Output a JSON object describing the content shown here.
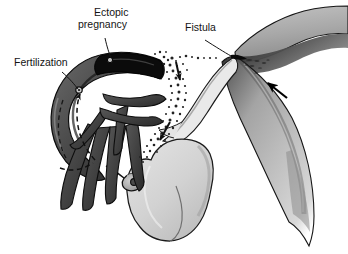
{
  "figure": {
    "kind": "medical-illustration",
    "background_color": "#ffffff",
    "ink_color": "#141414"
  },
  "labels": [
    {
      "id": "fertilization",
      "text": "Fertilization",
      "x": 14,
      "y": 66
    },
    {
      "id": "ectopic-pregnancy",
      "line1": "Ectopic",
      "line2": "pregnancy",
      "x": 78,
      "y": 16
    },
    {
      "id": "fistula",
      "text": "Fistula",
      "x": 185,
      "y": 31
    }
  ],
  "anatomy": {
    "fallopian_tube": {
      "name": "fallopian-tube",
      "fill": "#5d5d5d",
      "stroke": "#111111"
    },
    "ectopic_swelling": {
      "name": "ectopic-swelling",
      "fill": "#101010"
    },
    "fimbriae": {
      "name": "fimbriae",
      "fill": "#4a4a4a",
      "stroke": "#111111",
      "count": 7
    },
    "uterus": {
      "name": "uterus",
      "fill": "#d3d3d3",
      "stroke": "#1a1a1a"
    },
    "ovary": {
      "name": "ovary",
      "fill": "#9a9a9a",
      "stroke": "#111111"
    },
    "broad_ligament": {
      "name": "broad-ligament",
      "fill_light": "#c9c9c9",
      "fill_mid": "#9b9b9b",
      "fill_dark": "#3a3a3a",
      "stroke": "#111111"
    },
    "isthmus": {
      "name": "isthmus-tube",
      "fill": "#e6e6e6",
      "stroke": "#1a1a1a"
    }
  },
  "annotations": {
    "sperm_path_arrow": {
      "name": "sperm-path-arrow",
      "style": "dashed",
      "color": "#111111"
    },
    "spill_trail": {
      "name": "spill-stipple-trail",
      "dot_color": "#2a2a2a",
      "dots": 120
    },
    "spill_arrow_upper": {
      "name": "spill-arrow-upper",
      "color": "#101010"
    },
    "spill_arrow_lower": {
      "name": "spill-arrow-lower",
      "color": "#101010"
    },
    "ligament_arrow": {
      "name": "ligament-arrow",
      "color": "#000000"
    },
    "leader_lines": {
      "name": "leader-line",
      "color": "#141414",
      "width": 1
    }
  }
}
